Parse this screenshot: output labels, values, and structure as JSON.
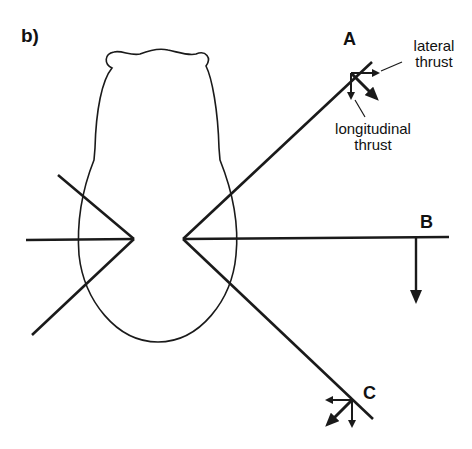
{
  "figure": {
    "panel_label": "b)",
    "points": {
      "a": "A",
      "b": "B",
      "c": "C"
    },
    "annotations": {
      "lateral_line1": "lateral",
      "lateral_line2": "thrust",
      "longitudinal_line1": "longitudinal",
      "longitudinal_line2": "thrust"
    },
    "colors": {
      "stroke": "#1a1a1a",
      "background": "#ffffff"
    }
  }
}
